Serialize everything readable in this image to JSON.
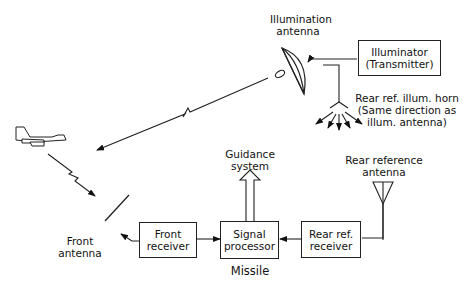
{
  "diagram": {
    "type": "block-diagram",
    "labels": {
      "illumination_antenna": [
        "Illumination",
        "antenna"
      ],
      "rear_ref_horn": [
        "Rear ref. illum. horn",
        "(Same direction as",
        "illum. antenna)"
      ],
      "guidance_system": [
        "Guidance",
        "system"
      ],
      "rear_reference_antenna": [
        "Rear reference",
        "antenna"
      ],
      "front_antenna": [
        "Front",
        "antenna"
      ],
      "missile": "Missile"
    },
    "blocks": {
      "illuminator": [
        "Illuminator",
        "(Transmitter)"
      ],
      "front_receiver": [
        "Front",
        "receiver"
      ],
      "signal_processor": [
        "Signal",
        "processor"
      ],
      "rear_ref_receiver": [
        "Rear ref.",
        "receiver"
      ]
    },
    "connections": [
      {
        "from": "Illuminator (Transmitter)",
        "to": "Illumination antenna"
      },
      {
        "from": "Illuminator (Transmitter)",
        "to": "Rear ref. illum. horn"
      },
      {
        "from": "Illumination antenna",
        "to": "Aircraft target"
      },
      {
        "from": "Aircraft target",
        "to": "Front antenna"
      },
      {
        "from": "Front receiver",
        "to": "Front antenna"
      },
      {
        "from": "Front receiver",
        "to": "Signal processor"
      },
      {
        "from": "Rear ref. receiver",
        "to": "Signal processor"
      },
      {
        "from": "Rear reference antenna",
        "to": "Rear ref. receiver"
      },
      {
        "from": "Signal processor",
        "to": "Guidance system"
      }
    ]
  }
}
